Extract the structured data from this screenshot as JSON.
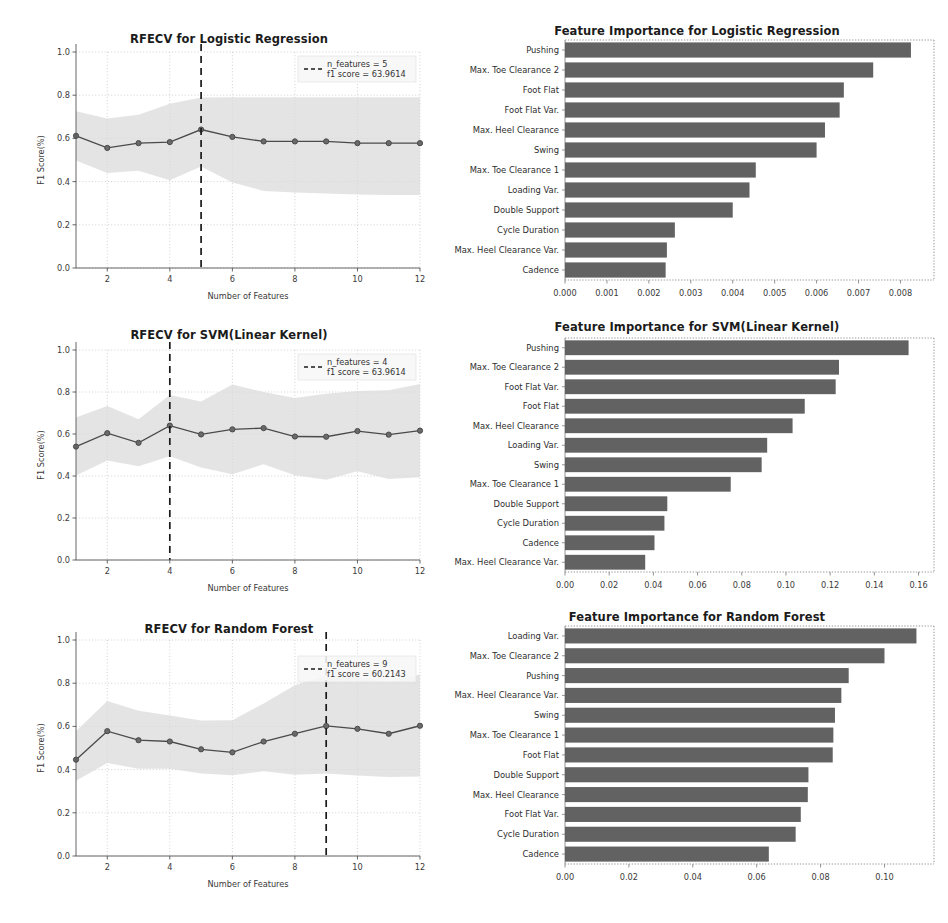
{
  "figure": {
    "background": "#ffffff",
    "line_color": "#4a4a4a",
    "band_color": "#d9d9d9",
    "bar_color": "#555555",
    "grid_color": "#bdbdbd",
    "vline_color": "#1a1a1a"
  },
  "common": {
    "xlabel": "Number of Features",
    "ylabel": "F1 Score(%)",
    "y_ticks": [
      "0.0",
      "0.2",
      "0.4",
      "0.6",
      "0.8",
      "1.0"
    ],
    "x_ticks": [
      "2",
      "4",
      "6",
      "8",
      "10",
      "12"
    ]
  },
  "chart_data": [
    {
      "id": "rfecv-logistic-regression",
      "type": "line",
      "title": "RFECV for Logistic Regression",
      "xlabel": "Number of Features",
      "ylabel": "F1 Score(%)",
      "xlim": [
        1,
        12
      ],
      "ylim": [
        0.0,
        1.0
      ],
      "grid": true,
      "legend_position": "upper right",
      "legend": {
        "n_features_label": "n_features = 5",
        "f1_score_label": "f1 score = 63.9614",
        "marker": "dashed-line"
      },
      "vline_x": 5,
      "x": [
        1,
        2,
        3,
        4,
        5,
        6,
        7,
        8,
        9,
        10,
        11,
        12
      ],
      "series": [
        {
          "name": "mean f1 score",
          "values": [
            0.612,
            0.556,
            0.578,
            0.583,
            0.641,
            0.607,
            0.586,
            0.586,
            0.586,
            0.578,
            0.578,
            0.578
          ]
        },
        {
          "name": "std upper",
          "values": [
            0.726,
            0.692,
            0.71,
            0.76,
            0.789,
            0.79,
            0.79,
            0.79,
            0.79,
            0.79,
            0.79,
            0.79
          ]
        },
        {
          "name": "std lower",
          "values": [
            0.498,
            0.44,
            0.45,
            0.406,
            0.47,
            0.396,
            0.357,
            0.35,
            0.345,
            0.34,
            0.338,
            0.338
          ]
        }
      ]
    },
    {
      "id": "rfecv-svm-linear-kernel",
      "type": "line",
      "title": "RFECV for SVM(Linear Kernel)",
      "xlabel": "Number of Features",
      "ylabel": "F1 Score(%)",
      "xlim": [
        1,
        12
      ],
      "ylim": [
        0.0,
        1.0
      ],
      "grid": true,
      "legend_position": "upper right",
      "legend": {
        "n_features_label": "n_features = 4",
        "f1_score_label": "f1 score = 63.9614",
        "marker": "dashed-line"
      },
      "vline_x": 4,
      "x": [
        1,
        2,
        3,
        4,
        5,
        6,
        7,
        8,
        9,
        10,
        11,
        12
      ],
      "series": [
        {
          "name": "mean f1 score",
          "values": [
            0.54,
            0.604,
            0.558,
            0.64,
            0.598,
            0.622,
            0.628,
            0.588,
            0.587,
            0.614,
            0.597,
            0.616
          ]
        },
        {
          "name": "std upper",
          "values": [
            0.678,
            0.733,
            0.67,
            0.786,
            0.755,
            0.836,
            0.8,
            0.772,
            0.792,
            0.805,
            0.808,
            0.838
          ]
        },
        {
          "name": "std lower",
          "values": [
            0.402,
            0.474,
            0.446,
            0.494,
            0.441,
            0.408,
            0.456,
            0.404,
            0.382,
            0.423,
            0.386,
            0.394
          ]
        }
      ]
    },
    {
      "id": "rfecv-random-forest",
      "type": "line",
      "title": "RFECV for Random Forest",
      "xlabel": "Number of Features",
      "ylabel": "F1 Score(%)",
      "xlim": [
        1,
        12
      ],
      "ylim": [
        0.0,
        1.0
      ],
      "grid": true,
      "legend_position": "upper right",
      "legend": {
        "n_features_label": "n_features = 9",
        "f1_score_label": "f1 score = 60.2143",
        "marker": "dashed-line"
      },
      "vline_x": 9,
      "x": [
        1,
        2,
        3,
        4,
        5,
        6,
        7,
        8,
        9,
        10,
        11,
        12
      ],
      "series": [
        {
          "name": "mean f1 score",
          "values": [
            0.446,
            0.578,
            0.536,
            0.53,
            0.494,
            0.48,
            0.53,
            0.566,
            0.602,
            0.589,
            0.566,
            0.603
          ]
        },
        {
          "name": "std upper",
          "values": [
            0.578,
            0.718,
            0.672,
            0.65,
            0.627,
            0.628,
            0.706,
            0.79,
            0.836,
            0.828,
            0.806,
            0.84
          ]
        },
        {
          "name": "std lower",
          "values": [
            0.348,
            0.43,
            0.404,
            0.404,
            0.382,
            0.374,
            0.392,
            0.376,
            0.382,
            0.373,
            0.366,
            0.368
          ]
        }
      ]
    },
    {
      "id": "importance-logistic-regression",
      "type": "bar",
      "orientation": "horizontal",
      "title": "Feature Importance for Logistic Regression",
      "xlabel": "",
      "ylabel": "",
      "xlim": [
        0.0,
        0.0088
      ],
      "grid": false,
      "x_ticks": [
        "0.000",
        "0.001",
        "0.002",
        "0.003",
        "0.004",
        "0.005",
        "0.006",
        "0.007",
        "0.008"
      ],
      "x_tick_values": [
        0.0,
        0.001,
        0.002,
        0.003,
        0.004,
        0.005,
        0.006,
        0.007,
        0.008
      ],
      "categories": [
        "Pushing",
        "Max. Toe Clearance 2",
        "Foot Flat",
        "Foot Flat Var.",
        "Max. Heel Clearance",
        "Swing",
        "Max. Toe Clearance 1",
        "Loading Var.",
        "Double Support",
        "Cycle Duration",
        "Max. Heel Clearance Var.",
        "Cadence"
      ],
      "values": [
        0.00825,
        0.00735,
        0.00665,
        0.00655,
        0.0062,
        0.006,
        0.00455,
        0.0044,
        0.004,
        0.00262,
        0.00243,
        0.0024
      ]
    },
    {
      "id": "importance-svm-linear-kernel",
      "type": "bar",
      "orientation": "horizontal",
      "title": "Feature Importance for SVM(Linear Kernel)",
      "xlabel": "",
      "ylabel": "",
      "xlim": [
        0.0,
        0.167
      ],
      "grid": false,
      "x_ticks": [
        "0.00",
        "0.02",
        "0.04",
        "0.06",
        "0.08",
        "0.10",
        "0.12",
        "0.14",
        "0.16"
      ],
      "x_tick_values": [
        0.0,
        0.02,
        0.04,
        0.06,
        0.08,
        0.1,
        0.12,
        0.14,
        0.16
      ],
      "categories": [
        "Pushing",
        "Max. Toe Clearance 2",
        "Foot Flat Var.",
        "Foot Flat",
        "Max. Heel Clearance",
        "Loading Var.",
        "Swing",
        "Max. Toe Clearance 1",
        "Double Support",
        "Cycle Duration",
        "Cadence",
        "Max. Heel Clearance Var."
      ],
      "values": [
        0.1555,
        0.124,
        0.1225,
        0.1085,
        0.103,
        0.0915,
        0.089,
        0.075,
        0.0463,
        0.045,
        0.0405,
        0.0363
      ]
    },
    {
      "id": "importance-random-forest",
      "type": "bar",
      "orientation": "horizontal",
      "title": "Feature Importance for Random Forest",
      "xlabel": "",
      "ylabel": "",
      "xlim": [
        0.0,
        0.1155
      ],
      "grid": false,
      "x_ticks": [
        "0.00",
        "0.02",
        "0.04",
        "0.06",
        "0.08",
        "0.10"
      ],
      "x_tick_values": [
        0.0,
        0.02,
        0.04,
        0.06,
        0.08,
        0.1
      ],
      "categories": [
        "Loading Var.",
        "Max. Toe Clearance 2",
        "Pushing",
        "Max. Heel Clearance Var.",
        "Swing",
        "Max. Toe Clearance 1",
        "Foot Flat",
        "Double Support",
        "Max. Heel Clearance",
        "Foot Flat Var.",
        "Cycle Duration",
        "Cadence"
      ],
      "values": [
        0.11,
        0.1,
        0.0888,
        0.0865,
        0.0845,
        0.084,
        0.0838,
        0.0762,
        0.076,
        0.0738,
        0.0722,
        0.0638
      ]
    }
  ]
}
